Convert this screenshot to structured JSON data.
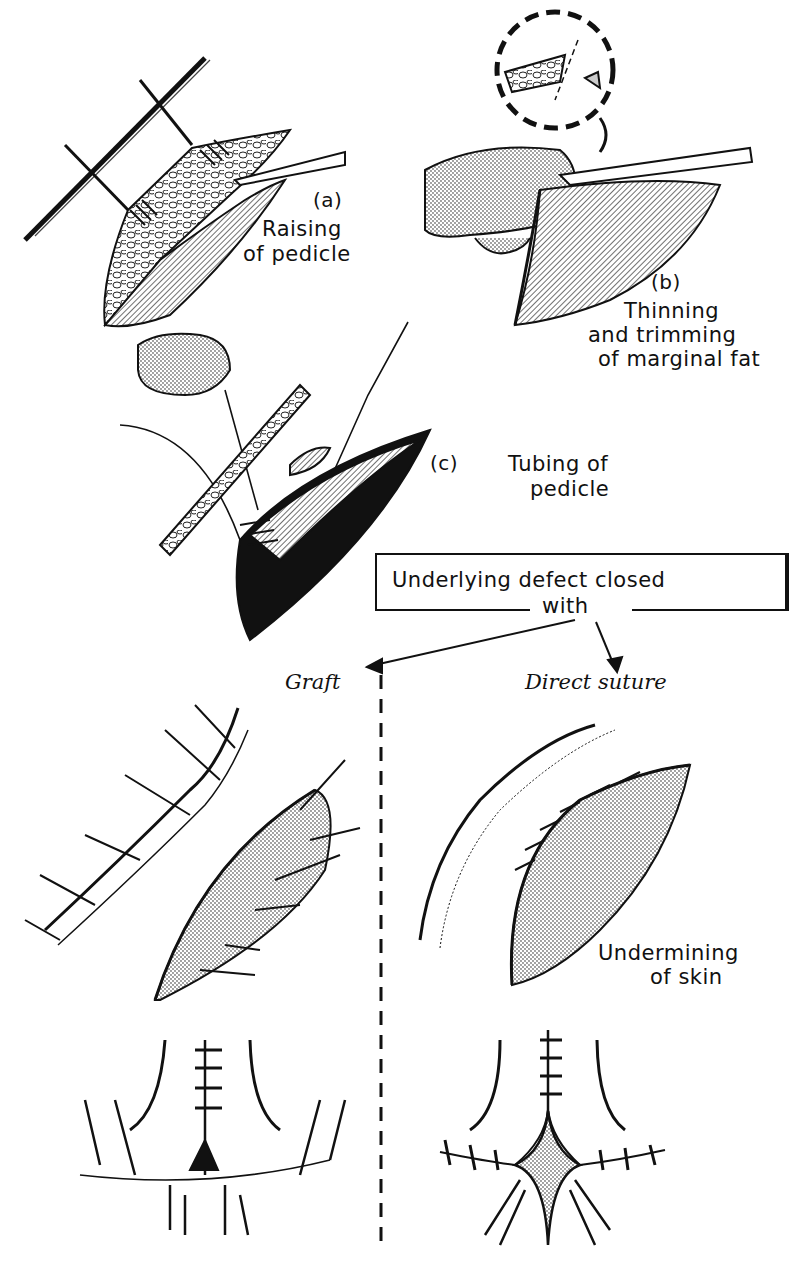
{
  "figure": {
    "panels": [
      {
        "id": "a",
        "marker": "(a)",
        "caption_lines": [
          "Raising",
          "of pedicle"
        ]
      },
      {
        "id": "b",
        "marker": "(b)",
        "caption_lines": [
          "Thinning",
          "and trimming",
          "of marginal fat"
        ]
      },
      {
        "id": "c",
        "marker": "(c)",
        "caption_lines": [
          "Tubing of",
          "pedicle"
        ]
      }
    ],
    "flow_box": {
      "line1": "Underlying defect closed",
      "line2": "with"
    },
    "branches": {
      "left": {
        "title": "Graft"
      },
      "right": {
        "title": "Direct suture",
        "annotation_lines": [
          "Undermining",
          "of skin"
        ]
      }
    },
    "colors": {
      "ink": "#111111",
      "paper": "#ffffff",
      "tone": "#bdbdbd"
    }
  }
}
